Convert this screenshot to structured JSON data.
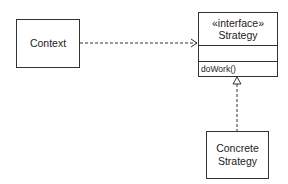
{
  "diagram": {
    "type": "UML class diagram",
    "context": {
      "label": "Context"
    },
    "strategy": {
      "stereotype": "«interface»",
      "name": "Strategy",
      "attributes": [],
      "operations": [
        "doWork()"
      ]
    },
    "concrete": {
      "line1": "Concrete",
      "line2": "Strategy"
    },
    "relations": [
      {
        "from": "Context",
        "to": "Strategy",
        "kind": "dependency",
        "style": "dashed",
        "arrow": "open"
      },
      {
        "from": "Concrete Strategy",
        "to": "Strategy",
        "kind": "realization",
        "style": "dashed",
        "arrow": "hollow-triangle"
      }
    ],
    "colors": {
      "line": "#333333",
      "background": "#ffffff"
    }
  }
}
